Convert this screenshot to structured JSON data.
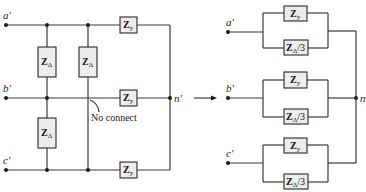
{
  "diagram": {
    "left_circuit": {
      "terminals": [
        "a'",
        "b'",
        "c'"
      ],
      "neutral_label": "n'",
      "wye_impedance": {
        "main": "Z",
        "sub": "y"
      },
      "delta_impedance": {
        "main": "Z",
        "sub": "Δ"
      },
      "annotation": "No connect"
    },
    "arrow": "→",
    "right_circuit": {
      "terminals": [
        "a'",
        "b'",
        "c'"
      ],
      "neutral_label": "n",
      "wye_impedance": {
        "main": "Z",
        "sub": "y"
      },
      "converted_impedance": {
        "main": "Z",
        "sub": "Δ",
        "suffix": "/3"
      }
    },
    "colors": {
      "wire": "#3a3a3a",
      "box_fill": "#ececec",
      "node": "#1a1a1a"
    }
  }
}
